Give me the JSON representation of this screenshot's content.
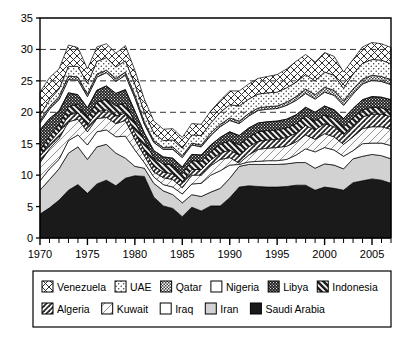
{
  "chart_data": {
    "type": "area",
    "title": "",
    "subtitle": "",
    "xlabel": "",
    "ylabel": "",
    "stacked": true,
    "grid": true,
    "grid_values": [
      20,
      25,
      30
    ],
    "legend_position": "bottom",
    "xlim": [
      1970,
      2007
    ],
    "ylim": [
      0,
      35
    ],
    "yticks": [
      0,
      5,
      10,
      15,
      20,
      25,
      30,
      35
    ],
    "ytick_labels": [
      "0",
      "5",
      "10",
      "15",
      "20",
      "25",
      "30",
      "35"
    ],
    "xticks": [
      1970,
      1975,
      1980,
      1985,
      1990,
      1995,
      2000,
      2005
    ],
    "xtick_labels": [
      "1970",
      "1975",
      "1980",
      "1985",
      "1990",
      "1995",
      "2000",
      "2005"
    ],
    "x": [
      1970,
      1971,
      1972,
      1973,
      1974,
      1975,
      1976,
      1977,
      1978,
      1979,
      1980,
      1981,
      1982,
      1983,
      1984,
      1985,
      1986,
      1987,
      1988,
      1989,
      1990,
      1991,
      1992,
      1993,
      1994,
      1995,
      1996,
      1997,
      1998,
      1999,
      2000,
      2001,
      2002,
      2003,
      2004,
      2005,
      2006,
      2007
    ],
    "series": [
      {
        "name": "Saudi Arabia",
        "pattern": "solid-black",
        "color": "#1a1a1a",
        "values": [
          3.8,
          4.8,
          6.0,
          7.6,
          8.5,
          7.1,
          8.6,
          9.2,
          8.3,
          9.5,
          9.9,
          9.8,
          6.5,
          5.1,
          4.7,
          3.4,
          4.9,
          4.3,
          5.1,
          5.1,
          6.4,
          8.1,
          8.3,
          8.2,
          8.1,
          8.1,
          8.2,
          8.4,
          8.4,
          7.6,
          8.1,
          7.9,
          7.6,
          8.8,
          9.1,
          9.4,
          9.2,
          8.7
        ]
      },
      {
        "name": "Iran",
        "pattern": "light-gray",
        "color": "#d0d0d0",
        "values": [
          3.8,
          4.5,
          5.0,
          5.9,
          6.0,
          5.4,
          5.9,
          5.7,
          5.2,
          3.2,
          1.5,
          1.3,
          2.2,
          2.4,
          2.2,
          2.2,
          2.0,
          2.3,
          2.2,
          2.8,
          3.1,
          3.3,
          3.4,
          3.5,
          3.6,
          3.6,
          3.6,
          3.6,
          3.6,
          3.5,
          3.7,
          3.7,
          3.4,
          3.8,
          3.9,
          3.9,
          3.9,
          3.9
        ]
      },
      {
        "name": "Iraq",
        "pattern": "white",
        "color": "#ffffff",
        "values": [
          1.5,
          1.7,
          1.5,
          2.0,
          1.9,
          2.3,
          2.4,
          2.3,
          2.6,
          3.5,
          2.6,
          0.9,
          1.0,
          1.0,
          1.2,
          1.4,
          1.7,
          2.1,
          2.7,
          2.8,
          2.1,
          0.3,
          0.4,
          0.5,
          0.6,
          0.6,
          0.7,
          1.2,
          2.2,
          2.6,
          2.6,
          2.4,
          2.0,
          1.3,
          2.0,
          1.8,
          2.0,
          2.1
        ]
      },
      {
        "name": "Kuwait",
        "pattern": "light-diagonal",
        "color": "#f2f2f2",
        "values": [
          2.9,
          3.2,
          3.3,
          3.0,
          2.5,
          2.1,
          2.1,
          2.0,
          2.1,
          2.5,
          1.7,
          1.1,
          0.8,
          1.1,
          1.2,
          1.0,
          1.4,
          1.3,
          1.5,
          1.8,
          1.2,
          0.2,
          1.1,
          1.9,
          2.0,
          2.1,
          2.1,
          2.1,
          2.2,
          2.0,
          2.2,
          2.1,
          1.9,
          2.2,
          2.4,
          2.6,
          2.6,
          2.6
        ]
      },
      {
        "name": "Algeria",
        "pattern": "diagonal-hatch",
        "color": "#e8e8e8",
        "values": [
          1.0,
          1.0,
          1.1,
          1.1,
          1.0,
          1.0,
          1.1,
          1.2,
          1.2,
          1.2,
          1.1,
          0.9,
          0.9,
          0.9,
          0.9,
          0.9,
          0.9,
          0.9,
          0.9,
          1.0,
          1.2,
          1.3,
          1.3,
          1.3,
          1.3,
          1.3,
          1.4,
          1.4,
          1.5,
          1.5,
          1.6,
          1.6,
          1.6,
          1.8,
          1.9,
          2.0,
          2.0,
          2.0
        ]
      },
      {
        "name": "Indonesia",
        "pattern": "thick-diagonal",
        "color": "#9a9a9a",
        "values": [
          0.9,
          1.0,
          1.1,
          1.3,
          1.4,
          1.3,
          1.5,
          1.7,
          1.6,
          1.6,
          1.6,
          1.6,
          1.3,
          1.3,
          1.4,
          1.3,
          1.4,
          1.3,
          1.3,
          1.4,
          1.5,
          1.6,
          1.5,
          1.5,
          1.5,
          1.5,
          1.5,
          1.5,
          1.5,
          1.4,
          1.4,
          1.3,
          1.2,
          1.2,
          1.1,
          1.1,
          1.0,
          1.0
        ]
      },
      {
        "name": "Libya",
        "pattern": "dark-checker",
        "color": "#2b2b2b",
        "values": [
          3.3,
          2.8,
          2.2,
          2.2,
          1.5,
          1.5,
          1.9,
          2.1,
          2.0,
          2.1,
          1.8,
          1.1,
          1.2,
          1.1,
          1.1,
          1.1,
          1.0,
          1.0,
          1.1,
          1.1,
          1.4,
          1.5,
          1.5,
          1.4,
          1.4,
          1.4,
          1.4,
          1.4,
          1.4,
          1.4,
          1.4,
          1.4,
          1.3,
          1.5,
          1.6,
          1.7,
          1.7,
          1.7
        ]
      },
      {
        "name": "Nigeria",
        "pattern": "horizontal-lines",
        "color": "#e0e0e0",
        "values": [
          1.1,
          1.5,
          1.8,
          2.1,
          2.3,
          1.8,
          2.1,
          2.1,
          1.9,
          2.3,
          2.1,
          1.4,
          1.3,
          1.2,
          1.4,
          1.5,
          1.5,
          1.3,
          1.5,
          1.7,
          1.8,
          1.9,
          1.9,
          2.0,
          2.0,
          2.0,
          2.2,
          2.3,
          2.2,
          2.1,
          2.2,
          2.3,
          2.1,
          2.3,
          2.5,
          2.6,
          2.5,
          2.4
        ]
      },
      {
        "name": "Qatar",
        "pattern": "fine-checker",
        "color": "#c8c8c8",
        "values": [
          0.4,
          0.4,
          0.5,
          0.6,
          0.5,
          0.4,
          0.5,
          0.4,
          0.5,
          0.5,
          0.5,
          0.4,
          0.3,
          0.3,
          0.4,
          0.3,
          0.3,
          0.3,
          0.4,
          0.4,
          0.4,
          0.4,
          0.4,
          0.4,
          0.4,
          0.4,
          0.5,
          0.6,
          0.7,
          0.7,
          0.8,
          0.8,
          0.7,
          0.8,
          0.8,
          0.8,
          0.8,
          0.8
        ]
      },
      {
        "name": "UAE",
        "pattern": "dotted",
        "color": "#f5f5f5",
        "values": [
          0.8,
          1.1,
          1.2,
          1.5,
          1.7,
          1.7,
          2.0,
          2.0,
          1.8,
          1.8,
          1.7,
          1.5,
          1.2,
          1.1,
          1.1,
          1.2,
          1.3,
          1.5,
          1.6,
          1.9,
          2.1,
          2.4,
          2.3,
          2.2,
          2.2,
          2.2,
          2.3,
          2.3,
          2.3,
          2.2,
          2.4,
          2.4,
          2.0,
          2.4,
          2.5,
          2.5,
          2.6,
          2.5
        ]
      },
      {
        "name": "Venezuela",
        "pattern": "crosshatch",
        "color": "#eeeeee",
        "values": [
          3.7,
          3.5,
          3.2,
          3.4,
          3.0,
          2.3,
          2.3,
          2.2,
          2.2,
          2.4,
          2.2,
          2.1,
          1.9,
          1.8,
          1.8,
          1.7,
          1.8,
          1.8,
          1.9,
          1.9,
          2.2,
          2.4,
          2.4,
          2.5,
          2.6,
          2.8,
          3.0,
          3.3,
          3.2,
          3.0,
          3.1,
          3.0,
          2.6,
          2.3,
          2.6,
          2.7,
          2.6,
          2.6
        ]
      }
    ]
  },
  "legend": {
    "rows": [
      [
        {
          "label": "Venezuela",
          "pattern": "crosshatch"
        },
        {
          "label": "UAE",
          "pattern": "dotted"
        },
        {
          "label": "Qatar",
          "pattern": "fine-checker"
        },
        {
          "label": "Nigeria",
          "pattern": "horizontal-lines"
        },
        {
          "label": "Libya",
          "pattern": "dark-checker"
        },
        {
          "label": "Indonesia",
          "pattern": "thick-diagonal"
        }
      ],
      [
        {
          "label": "Algeria",
          "pattern": "diagonal-hatch"
        },
        {
          "label": "Kuwait",
          "pattern": "light-diagonal"
        },
        {
          "label": "Iraq",
          "pattern": "white"
        },
        {
          "label": "Iran",
          "pattern": "light-gray"
        },
        {
          "label": "Saudi Arabia",
          "pattern": "solid-black"
        }
      ]
    ]
  },
  "colors": {
    "axis": "#000000",
    "grid": "#333333",
    "background": "#ffffff",
    "frame": "#000000"
  }
}
